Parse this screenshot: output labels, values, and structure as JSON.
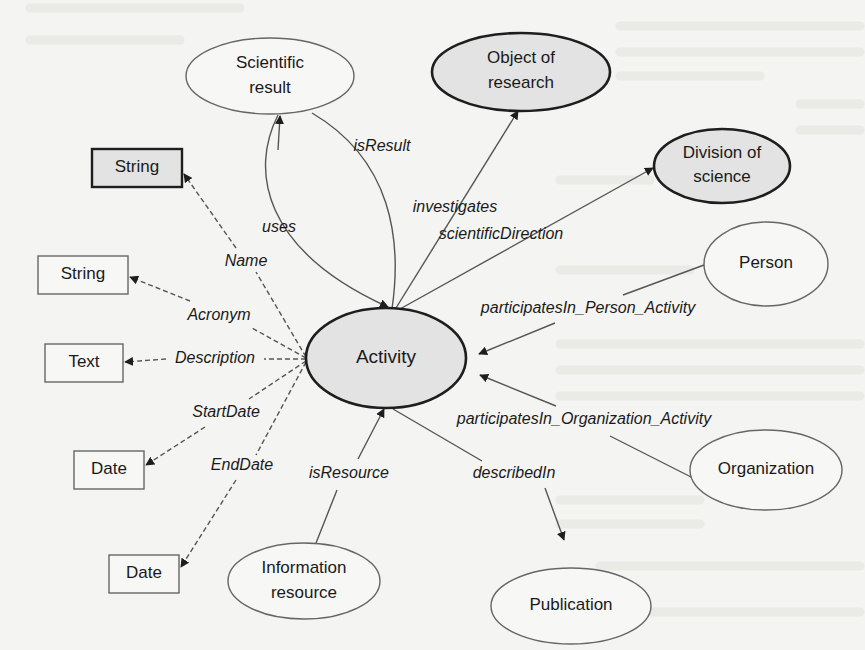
{
  "figure": {
    "background_color": "#f4f4f2",
    "colors": {
      "line": "#555555",
      "bold_outline": "#1e1e1e",
      "class_fill": "#e3e3e3",
      "plain_fill": "#f7f7f5",
      "text": "#1a1a1a"
    }
  },
  "nodes": {
    "activity": {
      "label": "Activity",
      "shape": "ellipse",
      "style": "bold",
      "cx": 386,
      "cy": 358,
      "rx": 80,
      "ry": 50
    },
    "scientific_result": {
      "label_line1": "Scientific",
      "label_line2": "result",
      "shape": "ellipse",
      "style": "light",
      "cx": 270,
      "cy": 76,
      "rx": 84,
      "ry": 38
    },
    "object_of_research": {
      "label_line1": "Object of",
      "label_line2": "research",
      "shape": "ellipse",
      "style": "bold",
      "cx": 521,
      "cy": 72,
      "rx": 89,
      "ry": 39
    },
    "division_of_science": {
      "label_line1": "Division of",
      "label_line2": "science",
      "shape": "ellipse",
      "style": "bold",
      "cx": 722,
      "cy": 166,
      "rx": 68,
      "ry": 37
    },
    "person": {
      "label": "Person",
      "shape": "ellipse",
      "style": "light",
      "cx": 766,
      "cy": 264,
      "rx": 62,
      "ry": 42
    },
    "organization": {
      "label": "Organization",
      "shape": "ellipse",
      "style": "light",
      "cx": 766,
      "cy": 470,
      "rx": 76,
      "ry": 40
    },
    "publication": {
      "label": "Publication",
      "shape": "ellipse",
      "style": "light",
      "cx": 571,
      "cy": 606,
      "rx": 80,
      "ry": 38
    },
    "information_resource": {
      "label_line1": "Information",
      "label_line2": "resource",
      "shape": "ellipse",
      "style": "light",
      "cx": 304,
      "cy": 581,
      "rx": 76,
      "ry": 38
    },
    "string_name": {
      "label": "String",
      "shape": "rect",
      "style": "bold",
      "x": 92,
      "y": 149,
      "w": 90,
      "h": 38
    },
    "string_acronym": {
      "label": "String",
      "shape": "rect",
      "style": "light",
      "x": 38,
      "y": 256,
      "w": 90,
      "h": 38
    },
    "text_description": {
      "label": "Text",
      "shape": "rect",
      "style": "light",
      "x": 45,
      "y": 344,
      "w": 78,
      "h": 38
    },
    "date_start": {
      "label": "Date",
      "shape": "rect",
      "style": "light",
      "x": 74,
      "y": 451,
      "w": 70,
      "h": 38
    },
    "date_end": {
      "label": "Date",
      "shape": "rect",
      "style": "light",
      "x": 109,
      "y": 555,
      "w": 70,
      "h": 38
    }
  },
  "edges": {
    "isResult": {
      "label": "isResult",
      "type": "object-property",
      "from": "Activity",
      "to": "Scientific result",
      "label_x": 382,
      "label_y": 147
    },
    "uses": {
      "label": "uses",
      "type": "object-property",
      "from": "Scientific result",
      "to": "Activity",
      "label_x": 279,
      "label_y": 228
    },
    "investigates": {
      "label": "investigates",
      "type": "object-property",
      "from": "Activity",
      "to": "Object of research",
      "label_x": 455,
      "label_y": 208
    },
    "scientificDirection": {
      "label": "scientificDirection",
      "type": "object-property",
      "from": "Activity",
      "to": "Division of science",
      "label_x": 501,
      "label_y": 235
    },
    "participatesIn_Person_Activity": {
      "label": "participatesIn_Person_Activity",
      "type": "object-property",
      "from": "Person",
      "to": "Activity",
      "label_x": 588,
      "label_y": 309
    },
    "participatesIn_Organization_Activity": {
      "label": "participatesIn_Organization_Activity",
      "type": "object-property",
      "from": "Organization",
      "to": "Activity",
      "label_x": 584,
      "label_y": 420
    },
    "isResource": {
      "label": "isResource",
      "type": "object-property",
      "from": "Information resource",
      "to": "Activity",
      "label_x": 349,
      "label_y": 474
    },
    "describedIn": {
      "label": "describedIn",
      "type": "object-property",
      "from": "Activity",
      "to": "Publication",
      "label_x": 514,
      "label_y": 474
    },
    "Name": {
      "label": "Name",
      "type": "data-property",
      "from": "Activity",
      "to": "String",
      "label_x": 246,
      "label_y": 262
    },
    "Acronym": {
      "label": "Acronym",
      "type": "data-property",
      "from": "Activity",
      "to": "String",
      "label_x": 219,
      "label_y": 316
    },
    "Description": {
      "label": "Description",
      "type": "data-property",
      "from": "Activity",
      "to": "Text",
      "label_x": 215,
      "label_y": 359
    },
    "StartDate": {
      "label": "StartDate",
      "type": "data-property",
      "from": "Activity",
      "to": "Date",
      "label_x": 226,
      "label_y": 413
    },
    "EndDate": {
      "label": "EndDate",
      "type": "data-property",
      "from": "Activity",
      "to": "Date",
      "label_x": 242,
      "label_y": 466
    }
  }
}
